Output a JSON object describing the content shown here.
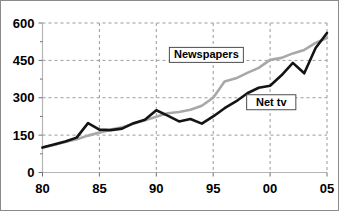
{
  "chart_data": {
    "type": "line",
    "title": "",
    "subtitle": "",
    "xlabel": "",
    "ylabel": "",
    "xlim": [
      1980,
      2005
    ],
    "ylim": [
      0,
      600
    ],
    "grid": true,
    "legend_position": "inline-annotations",
    "x": [
      1980,
      1981,
      1982,
      1983,
      1984,
      1985,
      1986,
      1987,
      1988,
      1989,
      1990,
      1991,
      1992,
      1993,
      1994,
      1995,
      1996,
      1997,
      1998,
      1999,
      2000,
      2001,
      2002,
      2003,
      2004,
      2005
    ],
    "x_tick_labels": [
      "80",
      "85",
      "90",
      "95",
      "00",
      "05"
    ],
    "x_tick_values": [
      1980,
      1985,
      1990,
      1995,
      2000,
      2005
    ],
    "y_tick_labels": [
      "0",
      "150",
      "300",
      "450",
      "600"
    ],
    "y_tick_values": [
      0,
      150,
      300,
      450,
      600
    ],
    "series": [
      {
        "name": "Newspapers",
        "color": "#a8a8a8",
        "values": [
          100,
          110,
          122,
          133,
          148,
          160,
          172,
          182,
          196,
          210,
          224,
          238,
          243,
          252,
          268,
          300,
          365,
          378,
          400,
          420,
          452,
          460,
          478,
          492,
          520,
          540
        ]
      },
      {
        "name": "Net tv",
        "color": "#141414",
        "values": [
          100,
          112,
          124,
          140,
          198,
          172,
          170,
          176,
          198,
          212,
          250,
          228,
          205,
          215,
          196,
          225,
          258,
          285,
          318,
          340,
          348,
          390,
          440,
          398,
          500,
          560
        ]
      }
    ],
    "annotations": [
      {
        "text": "Newspapers",
        "x": 1994.4,
        "y": 472
      },
      {
        "text": "Net tv",
        "x": 2000.1,
        "y": 282
      }
    ]
  }
}
